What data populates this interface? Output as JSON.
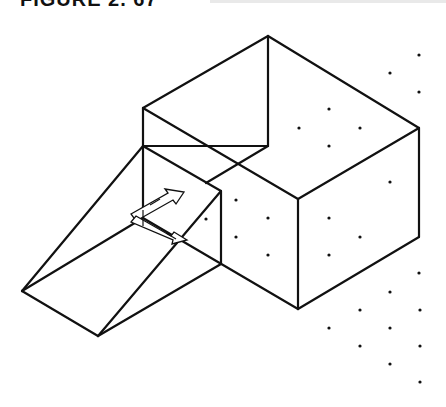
{
  "figure": {
    "caption": "FIGURE 2. 67",
    "line_color": "#111111",
    "dot_color": "#111111",
    "background": "#ffffff"
  },
  "drawing": {
    "type": "isometric wireframe",
    "objects": [
      "box",
      "ramp",
      "ucs-icon",
      "snap-grid-dots"
    ],
    "box_edges": [
      [
        268,
        36,
        419,
        128
      ],
      [
        268,
        36,
        143,
        108
      ],
      [
        268,
        36,
        268,
        146
      ],
      [
        143,
        108,
        298,
        199
      ],
      [
        298,
        199,
        419,
        128
      ],
      [
        298,
        199,
        298,
        309
      ],
      [
        419,
        128,
        419,
        237
      ],
      [
        419,
        237,
        298,
        309
      ],
      [
        143,
        108,
        143,
        218
      ],
      [
        143,
        146,
        268,
        146
      ],
      [
        268,
        146,
        206,
        183
      ],
      [
        143,
        218,
        298,
        309
      ]
    ],
    "ramp_edges": [
      [
        22,
        291,
        143,
        146
      ],
      [
        22,
        291,
        143,
        218
      ],
      [
        22,
        291,
        98,
        336
      ],
      [
        98,
        336,
        221,
        191
      ],
      [
        98,
        336,
        221,
        264
      ],
      [
        221,
        191,
        221,
        264
      ],
      [
        143,
        146,
        221,
        191
      ]
    ],
    "grid_dots": [
      [
        419,
        55
      ],
      [
        390,
        73
      ],
      [
        419,
        92
      ],
      [
        329,
        109
      ],
      [
        299,
        128
      ],
      [
        360,
        128
      ],
      [
        329,
        146
      ],
      [
        390,
        182
      ],
      [
        236,
        200
      ],
      [
        206,
        219
      ],
      [
        268,
        218
      ],
      [
        329,
        218
      ],
      [
        360,
        237
      ],
      [
        236,
        237
      ],
      [
        268,
        255
      ],
      [
        329,
        255
      ],
      [
        419,
        273
      ],
      [
        390,
        292
      ],
      [
        360,
        310
      ],
      [
        420,
        310
      ],
      [
        329,
        328
      ],
      [
        390,
        328
      ],
      [
        360,
        346
      ],
      [
        420,
        346
      ],
      [
        390,
        364
      ],
      [
        420,
        382
      ]
    ]
  }
}
